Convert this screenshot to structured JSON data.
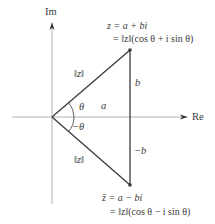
{
  "diagram": {
    "axes": {
      "imaginary_label": "Im",
      "real_label": "Re"
    },
    "points": {
      "z": {
        "line1": "z = a + bi",
        "line2": "= ‖z‖(cos θ + i sin θ)"
      },
      "z_conjugate": {
        "line1": "z̄ = a − bi",
        "line2": "= ‖z‖(cos θ − i sin θ)"
      }
    },
    "segments": {
      "upper_modulus": "‖z‖",
      "lower_modulus": "‖z‖",
      "real_part": "a",
      "imag_part_upper": "b",
      "imag_part_lower": "−b"
    },
    "angles": {
      "upper": "θ",
      "lower": "−θ"
    },
    "colors": {
      "axis": "#9a9a9a",
      "triangle": "#3a3a3a",
      "text": "#3a3a3a"
    }
  }
}
